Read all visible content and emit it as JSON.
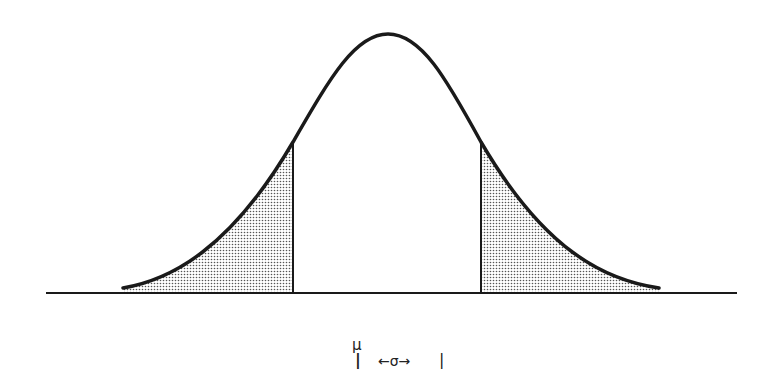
{
  "diagram": {
    "title": "",
    "labels": {
      "mean": "μ",
      "mean_tick": "|",
      "sigma_span": "←σ→",
      "sigma_tick": "|"
    },
    "colors": {
      "curve": "#1a1a1a",
      "baseline": "#1a1a1a",
      "shade": "#9a9a9a",
      "background": "#ffffff"
    }
  }
}
